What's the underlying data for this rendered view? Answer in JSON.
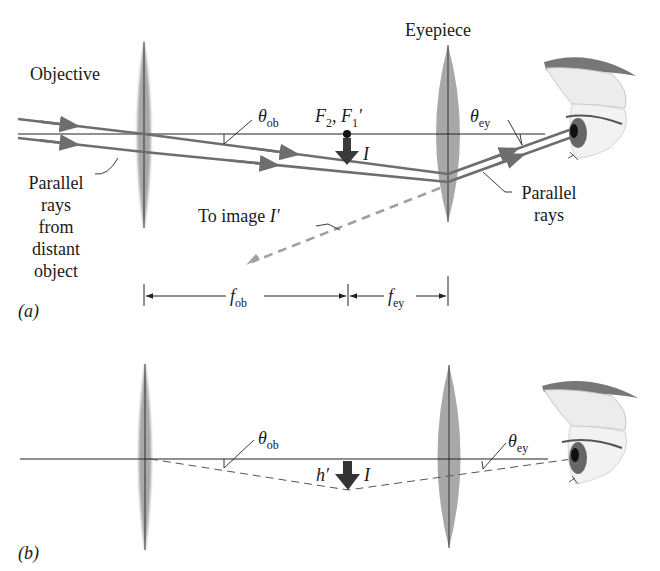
{
  "figure": {
    "panel_a": {
      "label": "(a)",
      "objective_label": "Objective",
      "eyepiece_label": "Eyepiece",
      "theta_ob": {
        "symbol": "θ",
        "sub": "ob"
      },
      "theta_ey": {
        "symbol": "θ",
        "sub": "ey"
      },
      "focal_points": {
        "f2": "F",
        "f2_sub": "2",
        "sep": ", ",
        "f1": "F",
        "f1_sub": "1",
        "f1_prime": "′"
      },
      "image_label": "I",
      "parallel_rays_left": [
        "Parallel",
        "rays",
        "from",
        "distant",
        "object"
      ],
      "parallel_rays_right": [
        "Parallel",
        "rays"
      ],
      "to_image_label": "To image ",
      "to_image_symbol": "I′",
      "dim_f_ob": {
        "symbol": "f",
        "sub": "ob"
      },
      "dim_f_ey": {
        "symbol": "f",
        "sub": "ey"
      }
    },
    "panel_b": {
      "label": "(b)",
      "theta_ob": {
        "symbol": "θ",
        "sub": "ob"
      },
      "theta_ey": {
        "symbol": "θ",
        "sub": "ey"
      },
      "h_prime": "h′",
      "image_label": "I"
    },
    "colors": {
      "ray": "#6e6e6e",
      "axis": "#222222",
      "lens": "#a8a8a8",
      "arrow": "#3a3a3a",
      "dashed_ray": "#a0a0a0"
    }
  }
}
